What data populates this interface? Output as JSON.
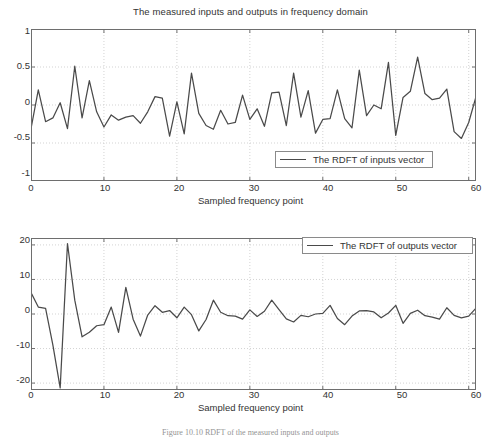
{
  "figure": {
    "caption": "Figure 10.10   RDFT of the measured inputs and outputs",
    "line_color": "#4a4a4a",
    "axis_color": "#6e6e6e",
    "grid_color": "#c8c8c8",
    "background": "#ffffff"
  },
  "charts": [
    {
      "id": "inputs",
      "title": "The measured inputs and outputs in frequency domain",
      "xlabel": "Sampled frequency point",
      "ylabel": "",
      "legend": "The RDFT of inputs vector",
      "legend_position": "lower-right-inside",
      "xticks": [
        "0",
        "10",
        "20",
        "30",
        "40",
        "50",
        "60"
      ],
      "yticks": [
        "1",
        "0.5",
        "0",
        "-0.5",
        "-1"
      ]
    },
    {
      "id": "outputs",
      "title": "",
      "xlabel": "Sampled frequency point",
      "ylabel": "",
      "legend": "The RDFT of outputs vector",
      "legend_position": "upper-right-inside",
      "xticks": [
        "0",
        "10",
        "20",
        "30",
        "40",
        "50",
        "60"
      ],
      "yticks": [
        "20",
        "10",
        "0",
        "-10",
        "-20"
      ]
    }
  ],
  "chart_data": [
    {
      "type": "line",
      "title": "The measured inputs and outputs in frequency domain",
      "xlabel": "Sampled frequency point",
      "ylabel": "",
      "xlim": [
        0,
        61
      ],
      "ylim": [
        -1,
        1
      ],
      "xticks": [
        0,
        10,
        20,
        30,
        40,
        50,
        60
      ],
      "yticks": [
        -1,
        -0.5,
        0,
        0.5,
        1
      ],
      "grid": true,
      "legend": [
        "The RDFT of inputs vector"
      ],
      "legend_position": "lower right",
      "series": [
        {
          "name": "The RDFT of inputs vector",
          "x": [
            0,
            1,
            2,
            3,
            4,
            5,
            6,
            7,
            8,
            9,
            10,
            11,
            12,
            13,
            14,
            15,
            16,
            17,
            18,
            19,
            20,
            21,
            22,
            23,
            24,
            25,
            26,
            27,
            28,
            29,
            30,
            31,
            32,
            33,
            34,
            35,
            36,
            37,
            38,
            39,
            40,
            41,
            42,
            43,
            44,
            45,
            46,
            47,
            48,
            49,
            50,
            51,
            52,
            53,
            54,
            55,
            56,
            57,
            58,
            59,
            60,
            61
          ],
          "values": [
            -0.31,
            0.2,
            -0.22,
            -0.17,
            0.03,
            -0.31,
            0.51,
            -0.17,
            0.32,
            -0.09,
            -0.29,
            -0.13,
            -0.2,
            -0.16,
            -0.14,
            -0.24,
            -0.09,
            0.11,
            0.09,
            -0.41,
            0.04,
            -0.38,
            0.42,
            -0.11,
            -0.27,
            -0.32,
            -0.07,
            -0.25,
            -0.23,
            0.13,
            -0.19,
            -0.05,
            -0.28,
            0.16,
            0.17,
            -0.27,
            0.42,
            -0.16,
            0.19,
            -0.37,
            -0.19,
            -0.18,
            0.2,
            -0.18,
            -0.3,
            0.46,
            -0.14,
            0.0,
            -0.05,
            0.56,
            -0.4,
            0.1,
            0.18,
            0.63,
            0.15,
            0.07,
            0.09,
            0.21,
            -0.35,
            -0.44,
            -0.23,
            0.11
          ]
        }
      ]
    },
    {
      "type": "line",
      "title": "",
      "xlabel": "Sampled frequency point",
      "ylabel": "",
      "xlim": [
        0,
        61
      ],
      "ylim": [
        -22,
        22
      ],
      "xticks": [
        0,
        10,
        20,
        30,
        40,
        50,
        60
      ],
      "yticks": [
        -20,
        -10,
        0,
        10,
        20
      ],
      "grid": true,
      "legend": [
        "The RDFT of outputs vector"
      ],
      "legend_position": "upper right",
      "series": [
        {
          "name": "The RDFT of outputs vector",
          "x": [
            0,
            1,
            2,
            3,
            4,
            5,
            6,
            7,
            8,
            9,
            10,
            11,
            12,
            13,
            14,
            15,
            16,
            17,
            18,
            19,
            20,
            21,
            22,
            23,
            24,
            25,
            26,
            27,
            28,
            29,
            30,
            31,
            32,
            33,
            34,
            35,
            36,
            37,
            38,
            39,
            40,
            41,
            42,
            43,
            44,
            45,
            46,
            47,
            48,
            49,
            50,
            51,
            52,
            53,
            54,
            55,
            56,
            57,
            58,
            59,
            60,
            61
          ],
          "values": [
            6.2,
            2.0,
            1.6,
            -9.0,
            -21.4,
            20.4,
            4.0,
            -6.6,
            -5.3,
            -3.4,
            -3.1,
            2.0,
            -5.3,
            7.7,
            -1.5,
            -6.4,
            -0.3,
            2.4,
            0.5,
            1.0,
            -1.1,
            2.0,
            -0.2,
            -4.9,
            -1.6,
            4.0,
            0.5,
            -0.5,
            -0.6,
            -1.5,
            1.2,
            -0.7,
            0.8,
            4.0,
            1.3,
            -1.4,
            -2.3,
            -0.4,
            -0.8,
            0.0,
            0.2,
            2.5,
            -1.3,
            -3.1,
            -0.6,
            0.9,
            1.0,
            0.6,
            -1.1,
            0.3,
            2.5,
            -2.7,
            0.2,
            1.1,
            -0.5,
            -0.9,
            -1.5,
            1.8,
            -0.4,
            -1.1,
            -0.6,
            1.7
          ]
        }
      ]
    }
  ]
}
